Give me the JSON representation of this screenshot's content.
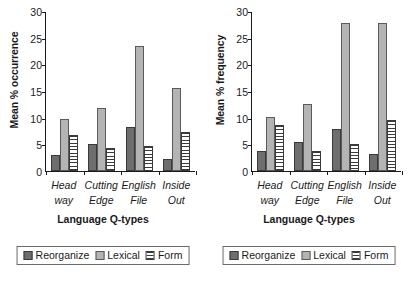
{
  "figure": {
    "panels": [
      "occurrence",
      "frequency"
    ]
  },
  "chart_data": [
    {
      "type": "bar",
      "title": "",
      "xlabel": "Language Q-types",
      "ylabel": "Mean % occurrence",
      "categories": [
        "Head way",
        "Cutting Edge",
        "English File",
        "Inside Out"
      ],
      "category_lines": [
        [
          "Head",
          "way"
        ],
        [
          "Cutting",
          "Edge"
        ],
        [
          "English",
          "File"
        ],
        [
          "Inside",
          "Out"
        ]
      ],
      "series": [
        {
          "name": "Reorganize",
          "color": "#6e6e6e",
          "pattern": "solid-dark",
          "values": [
            3.0,
            5.0,
            8.2,
            2.2
          ]
        },
        {
          "name": "Lexical",
          "color": "#b4b4b4",
          "pattern": "solid-light",
          "values": [
            9.8,
            11.8,
            23.5,
            15.6
          ]
        },
        {
          "name": "Form",
          "color": "#ffffff",
          "pattern": "horizontal-stripes",
          "values": [
            6.7,
            4.4,
            4.7,
            7.3
          ]
        }
      ],
      "ylim": [
        0,
        30
      ],
      "yticks": [
        0,
        5,
        10,
        15,
        20,
        25,
        30
      ],
      "grid": false,
      "legend_position": "below"
    },
    {
      "type": "bar",
      "title": "",
      "xlabel": "Language Q-types",
      "ylabel": "Mean % frequency",
      "categories": [
        "Head way",
        "Cutting Edge",
        "English File",
        "Inside Out"
      ],
      "category_lines": [
        [
          "Head",
          "way"
        ],
        [
          "Cutting",
          "Edge"
        ],
        [
          "English",
          "File"
        ],
        [
          "Inside",
          "Out"
        ]
      ],
      "series": [
        {
          "name": "Reorganize",
          "color": "#6e6e6e",
          "pattern": "solid-dark",
          "values": [
            3.7,
            5.4,
            7.8,
            3.2
          ]
        },
        {
          "name": "Lexical",
          "color": "#b4b4b4",
          "pattern": "solid-light",
          "values": [
            10.2,
            12.6,
            27.8,
            27.8
          ]
        },
        {
          "name": "Form",
          "color": "#ffffff",
          "pattern": "horizontal-stripes",
          "values": [
            8.7,
            3.8,
            5.0,
            9.5
          ]
        }
      ],
      "ylim": [
        0,
        30
      ],
      "yticks": [
        0,
        5,
        10,
        15,
        20,
        25,
        30
      ],
      "grid": false,
      "legend_position": "below"
    }
  ]
}
